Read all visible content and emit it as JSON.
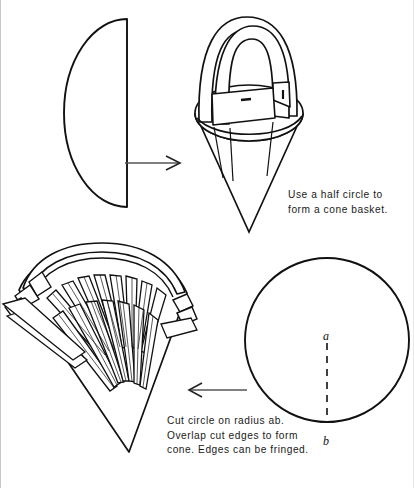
{
  "page": {
    "background_color": "#ffffff",
    "ink_color": "#111111",
    "width": 414,
    "height": 488
  },
  "figures": {
    "half_circle": {
      "name": "half-circle-template",
      "description": "Half circle shape with flat edge on the right"
    },
    "cone_basket": {
      "name": "cone-basket-with-handle",
      "description": "Finished cone basket with arched handle"
    },
    "fringed_basket": {
      "name": "fringed-cone-basket",
      "description": "Cone basket with fringed edges and handle"
    },
    "full_circle": {
      "name": "circle-with-radius",
      "description": "Full circle with dashed radius from center a to edge b"
    }
  },
  "arrows": {
    "top": {
      "label": "right-arrow",
      "direction": "right"
    },
    "bottom": {
      "label": "left-arrow",
      "direction": "left"
    }
  },
  "captions": {
    "top": {
      "lines": [
        "Use a half circle to",
        "form a cone basket."
      ]
    },
    "bottom": {
      "lines": [
        "Cut circle on radius ab.",
        "Overlap cut edges to form",
        "cone. Edges can be fringed."
      ]
    }
  },
  "labels": {
    "center_point": "a",
    "edge_point": "b"
  }
}
